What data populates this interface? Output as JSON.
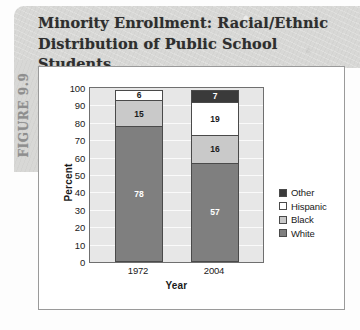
{
  "figure_label": "FIGURE 9.9",
  "title_line1": "Minority Enrollment: Racial/Ethnic",
  "title_line2": "Distribution of Public School Students",
  "colors": {
    "other": "#3a3a3a",
    "hispanic": "#ffffff",
    "black": "#c9c9c9",
    "white": "#7f7f7f",
    "plot_background": "#e7e7e7",
    "header_band": "#d8d8d6",
    "axis": "#6f6f6f"
  },
  "chart_data": {
    "type": "bar",
    "title": "Minority Enrollment: Racial/Ethnic Distribution of Public School Students",
    "stacked": true,
    "categories": [
      "1972",
      "2004"
    ],
    "xlabel": "Year",
    "ylabel": "Percent",
    "ylim": [
      0,
      100
    ],
    "ytick_step": 10,
    "yticks": [
      "100",
      "90",
      "80",
      "70",
      "60",
      "50",
      "40",
      "30",
      "20",
      "10",
      "0"
    ],
    "grid": true,
    "legend_position": "right",
    "series": [
      {
        "name": "White",
        "values": [
          78,
          57
        ],
        "color": "#7f7f7f",
        "label_color": "#ffffff"
      },
      {
        "name": "Black",
        "values": [
          15,
          16
        ],
        "color": "#c9c9c9",
        "label_color": "#1a1a1a"
      },
      {
        "name": "Hispanic",
        "values": [
          6,
          19
        ],
        "color": "#ffffff",
        "label_color": "#1a1a1a"
      },
      {
        "name": "Other",
        "values": [
          1,
          7
        ],
        "color": "#3a3a3a",
        "label_color": "#ffffff"
      }
    ],
    "legend_entries": [
      "Other",
      "Hispanic",
      "Black",
      "White"
    ]
  }
}
